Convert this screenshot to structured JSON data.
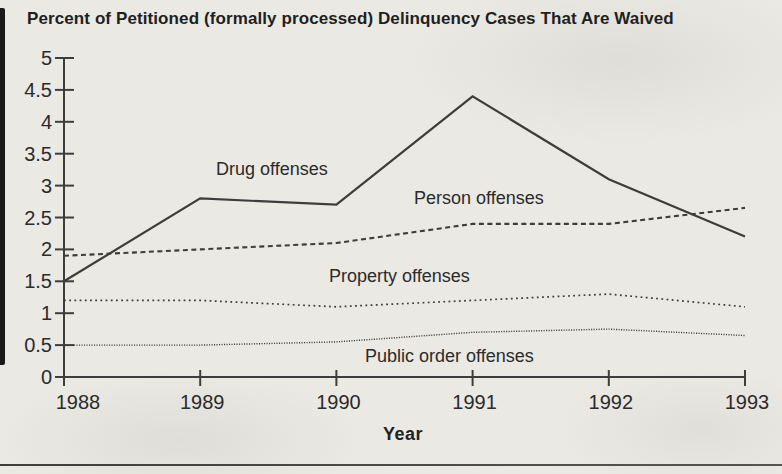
{
  "page": {
    "background_color": "#eae9e4",
    "line_color": "#3d3d3b",
    "text_color": "#2b2b2a"
  },
  "chart_data": {
    "type": "line",
    "title": "Percent of Petitioned (formally processed) Delinquency Cases That Are Waived",
    "xlabel": "Year",
    "ylabel": "",
    "x": [
      1988,
      1989,
      1990,
      1991,
      1992,
      1993
    ],
    "ylim": [
      0,
      5
    ],
    "y_ticks": [
      0,
      0.5,
      1,
      1.5,
      2,
      2.5,
      3,
      3.5,
      4,
      4.5,
      5
    ],
    "grid": false,
    "legend": "inline-labels",
    "series": [
      {
        "name": "Drug offenses",
        "style": "solid",
        "values": [
          1.5,
          2.8,
          2.7,
          4.4,
          3.1,
          2.2
        ]
      },
      {
        "name": "Person offenses",
        "style": "dashed",
        "values": [
          1.9,
          2.0,
          2.1,
          2.4,
          2.4,
          2.65
        ]
      },
      {
        "name": "Property offenses",
        "style": "dotted",
        "values": [
          1.2,
          1.2,
          1.1,
          1.2,
          1.3,
          1.1
        ]
      },
      {
        "name": "Public order offenses",
        "style": "fine-dotted",
        "values": [
          0.5,
          0.5,
          0.55,
          0.7,
          0.75,
          0.65
        ]
      }
    ]
  }
}
